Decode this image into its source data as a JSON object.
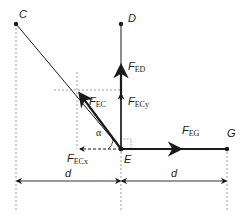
{
  "diagram": {
    "points": [
      {
        "id": "C",
        "label": "C",
        "x": 16,
        "y": 24
      },
      {
        "id": "D",
        "label": "D",
        "x": 121,
        "y": 24
      },
      {
        "id": "E",
        "label": "E",
        "x": 121,
        "y": 149
      },
      {
        "id": "G",
        "label": "G",
        "x": 227,
        "y": 149
      }
    ],
    "members": [
      {
        "from": "C",
        "to": "E"
      },
      {
        "from": "D",
        "to": "E"
      },
      {
        "from": "E",
        "to": "G"
      }
    ],
    "forces": {
      "F_EC": {
        "main": "F",
        "sub": "EC"
      },
      "F_ED": {
        "main": "F",
        "sub": "ED"
      },
      "F_ECy": {
        "main": "F",
        "sub": "ECy"
      },
      "F_ECx": {
        "main": "F",
        "sub": "ECx"
      },
      "F_EG": {
        "main": "F",
        "sub": "EG"
      }
    },
    "angle_label": "α",
    "dimensions": [
      {
        "label": "d",
        "from_x": 16,
        "to_x": 121
      },
      {
        "label": "d",
        "from_x": 121,
        "to_x": 227
      }
    ],
    "colors": {
      "line": "#1a1a1a",
      "dashed": "#555555"
    }
  }
}
